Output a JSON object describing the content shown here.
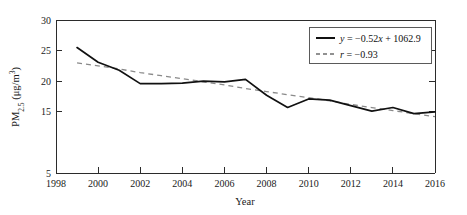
{
  "chart_data": {
    "type": "line",
    "title": "",
    "xlabel": "Year",
    "ylabel": "PM2.5 (μg/m³)",
    "ylabel_parts": {
      "prefix": "PM",
      "subscript": "2.5",
      "units_open": " (μg/m",
      "units_superscript": "3",
      "units_close": ")"
    },
    "x": [
      1999,
      2000,
      2001,
      2002,
      2003,
      2004,
      2005,
      2006,
      2007,
      2008,
      2009,
      2010,
      2011,
      2012,
      2013,
      2014,
      2015,
      2016
    ],
    "series": [
      {
        "name": "PM2.5 annual mean",
        "style": "solid",
        "color": "#111111",
        "values": [
          25.5,
          23.1,
          21.8,
          19.6,
          19.6,
          19.7,
          20.0,
          19.9,
          20.3,
          17.7,
          15.7,
          17.1,
          16.9,
          16.0,
          15.1,
          15.7,
          14.7,
          15.0
        ]
      },
      {
        "name": "Linear trend",
        "style": "dashed",
        "color": "#8a8a8a",
        "values": [
          23.0,
          22.5,
          22.0,
          21.4,
          20.9,
          20.4,
          19.9,
          19.4,
          18.8,
          18.3,
          17.8,
          17.3,
          16.8,
          16.2,
          15.7,
          15.2,
          14.7,
          14.2
        ]
      }
    ],
    "xlim": [
      1998,
      2016
    ],
    "ylim": [
      5,
      30
    ],
    "xticks": [
      1998,
      2000,
      2002,
      2004,
      2006,
      2008,
      2010,
      2012,
      2014,
      2016
    ],
    "xtick_labels": [
      "1998",
      "2000",
      "2002",
      "2004",
      "2006",
      "2008",
      "2010",
      "2012",
      "2014",
      "2016"
    ],
    "yticks": [
      5,
      15,
      20,
      25,
      30
    ],
    "ytick_labels": [
      "5",
      "15",
      "20",
      "25",
      "30"
    ],
    "grid": false,
    "legend_position": "top-right",
    "annotations": {
      "regression_equation": "y = −0.52x + 1062.9",
      "correlation": "r = −0.93"
    }
  },
  "legend": {
    "items": [
      {
        "label": "y = −0.52x + 1062.9",
        "italic_head": "y",
        "rest": " = −0.52",
        "italic_x": "x",
        "tail": " + 1062.9",
        "style": "solid"
      },
      {
        "label": "r = −0.93",
        "italic_head": "r",
        "rest": " = −0.93",
        "italic_x": "",
        "tail": "",
        "style": "dashed"
      }
    ]
  },
  "axes": {
    "x_title": "Year",
    "y_title": "PM2.5 (μg/m³)"
  },
  "colors": {
    "series": "#111111",
    "trend": "#8a8a8a",
    "axis": "#2b2b2b",
    "background": "#ffffff"
  }
}
